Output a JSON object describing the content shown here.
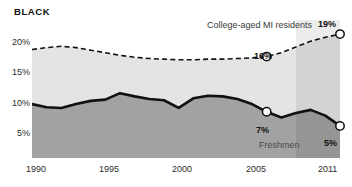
{
  "chart_data": {
    "type": "area",
    "title": "BLACK",
    "xlabel": "",
    "ylabel": "",
    "grid": false,
    "legend_position": "inline-annotations",
    "xlim": [
      1990,
      2011
    ],
    "ylim": [
      0,
      21.5
    ],
    "y_ticks": [
      "20%",
      "15%",
      "10%",
      "5%"
    ],
    "y_tick_values": [
      20,
      15,
      10,
      5
    ],
    "x_ticks": [
      "1990",
      "1995",
      "2000",
      "2005",
      "2011"
    ],
    "x_tick_values": [
      1990,
      1995,
      2000,
      2005,
      2011
    ],
    "x": [
      1990,
      1991,
      1992,
      1993,
      1994,
      1995,
      1996,
      1997,
      1998,
      1999,
      2000,
      2001,
      2002,
      2003,
      2004,
      2005,
      2006,
      2007,
      2008,
      2009,
      2010,
      2011
    ],
    "series": [
      {
        "name": "College-aged MI residents",
        "style": "dashed",
        "values": [
          16.9,
          17.2,
          17.4,
          17.2,
          16.8,
          16.4,
          16.0,
          15.7,
          15.5,
          15.4,
          15.3,
          15.3,
          15.4,
          15.4,
          15.5,
          15.6,
          15.8,
          16.4,
          17.3,
          18.2,
          18.8,
          19.3
        ]
      },
      {
        "name": "Freshmen",
        "style": "solid",
        "values": [
          8.4,
          7.9,
          7.8,
          8.4,
          8.9,
          9.1,
          10.1,
          9.6,
          9.2,
          9.0,
          7.8,
          9.3,
          9.7,
          9.6,
          9.2,
          8.4,
          7.2,
          6.3,
          7.0,
          7.5,
          6.6,
          5.0
        ]
      }
    ],
    "annotations": [
      {
        "label": "College-aged MI residents",
        "kind": "series-label",
        "series": "College-aged MI residents"
      },
      {
        "label": "19%",
        "kind": "value",
        "series": "College-aged MI residents",
        "x": 2011,
        "y": 19
      },
      {
        "label": "16%",
        "kind": "value",
        "series": "College-aged MI residents",
        "x": 2006,
        "y": 15.8
      },
      {
        "label": "Freshmen",
        "kind": "series-label",
        "series": "Freshmen"
      },
      {
        "label": "7%",
        "kind": "value",
        "series": "Freshmen",
        "x": 2006,
        "y": 7.2
      },
      {
        "label": "5%",
        "kind": "value",
        "series": "Freshmen",
        "x": 2011,
        "y": 5
      }
    ],
    "markers": [
      {
        "series": "College-aged MI residents",
        "x": 2006,
        "y": 15.8
      },
      {
        "series": "College-aged MI residents",
        "x": 2011,
        "y": 19.3
      },
      {
        "series": "Freshmen",
        "x": 2006,
        "y": 7.2
      },
      {
        "series": "Freshmen",
        "x": 2011,
        "y": 5.0
      }
    ],
    "highlight_band": {
      "from": 2008,
      "to": 2011
    },
    "colors": {
      "upper_band": "#e4e4e4",
      "lower_band": "#a2a2a2",
      "upper_band_highlight": "#d2d2d2",
      "lower_band_highlight": "#949494",
      "line": "#111111",
      "marker_fill": "#ffffff",
      "text": "#2b2b2b",
      "background": "#ffffff"
    }
  }
}
